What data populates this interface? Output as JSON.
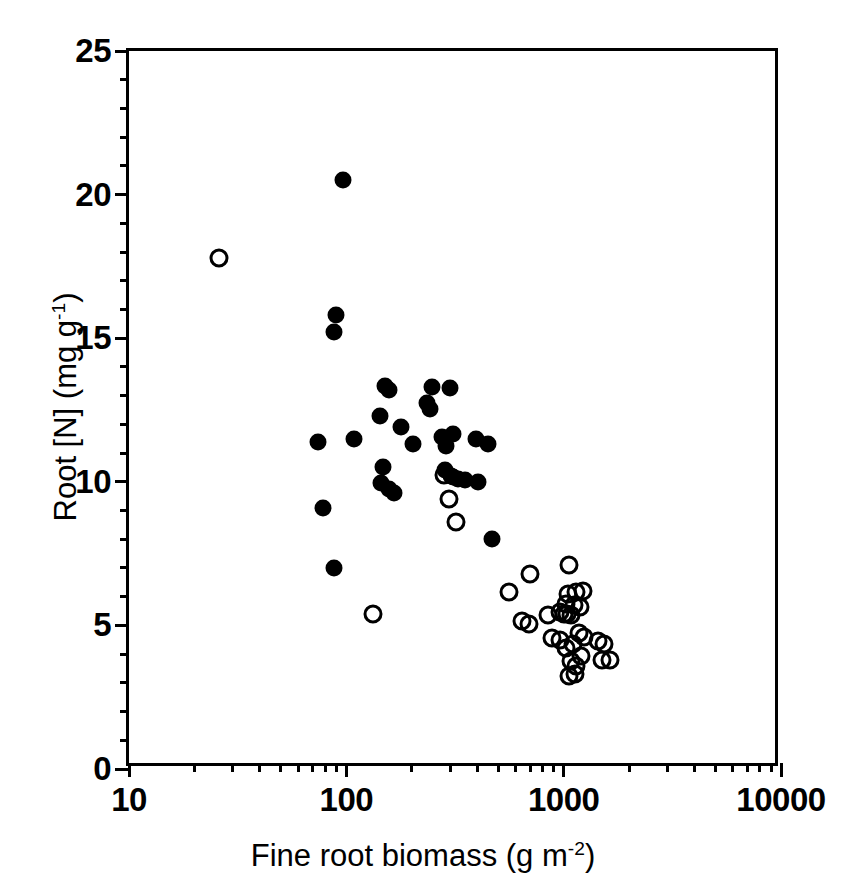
{
  "figure": {
    "background_color": "#ffffff",
    "foreground_color": "#000000"
  },
  "chart_data": {
    "type": "scatter",
    "title": "",
    "xlabel": "Fine root biomass (g m-2)",
    "xlabel_base": "Fine root biomass (g m",
    "xlabel_exp": "-2",
    "xlabel_tail": ")",
    "ylabel": "Root [N] (mg g-1)",
    "ylabel_base": "Root [N] (mg g",
    "ylabel_exp": "-1",
    "ylabel_tail": ")",
    "xscale": "log",
    "yscale": "linear",
    "xlim": [
      10,
      10000
    ],
    "ylim": [
      0,
      25
    ],
    "grid": false,
    "legend": null,
    "x_ticks_major": [
      10,
      100,
      1000,
      10000
    ],
    "x_tick_labels": [
      "10",
      "100",
      "1000",
      "10000"
    ],
    "x_ticks_minor": [
      20,
      30,
      40,
      50,
      60,
      70,
      80,
      90,
      200,
      300,
      400,
      500,
      600,
      700,
      800,
      900,
      2000,
      3000,
      4000,
      5000,
      6000,
      7000,
      8000,
      9000
    ],
    "y_ticks_major": [
      0,
      5,
      10,
      15,
      20,
      25
    ],
    "y_tick_labels": [
      "0",
      "5",
      "10",
      "15",
      "20",
      "25"
    ],
    "y_ticks_minor": [
      1,
      2,
      3,
      4,
      6,
      7,
      8,
      9,
      11,
      12,
      13,
      14,
      16,
      17,
      18,
      19,
      21,
      22,
      23,
      24
    ],
    "marker_color": "#000000",
    "series": [
      {
        "name": "filled-circles",
        "marker": "filled-circle",
        "color": "#000000",
        "points": [
          [
            97,
            20.5
          ],
          [
            90,
            15.8
          ],
          [
            88,
            15.2
          ],
          [
            74,
            11.4
          ],
          [
            151,
            13.35
          ],
          [
            157,
            13.2
          ],
          [
            247,
            13.3
          ],
          [
            300,
            13.25
          ],
          [
            143,
            12.3
          ],
          [
            236,
            12.75
          ],
          [
            242,
            12.55
          ],
          [
            108,
            11.5
          ],
          [
            178,
            11.9
          ],
          [
            202,
            11.3
          ],
          [
            277,
            11.55
          ],
          [
            308,
            11.65
          ],
          [
            395,
            11.5
          ],
          [
            286,
            11.25
          ],
          [
            450,
            11.3
          ],
          [
            78,
            9.1
          ],
          [
            148,
            10.5
          ],
          [
            145,
            9.95
          ],
          [
            157,
            9.75
          ],
          [
            166,
            9.6
          ],
          [
            284,
            10.4
          ],
          [
            303,
            10.2
          ],
          [
            311,
            10.15
          ],
          [
            327,
            10.1
          ],
          [
            352,
            10.05
          ],
          [
            404,
            10.0
          ],
          [
            88,
            7.0
          ],
          [
            470,
            8.0
          ]
        ]
      },
      {
        "name": "open-circles",
        "marker": "open-circle",
        "color": "#000000",
        "points": [
          [
            26,
            17.8
          ],
          [
            281,
            10.25
          ],
          [
            297,
            9.4
          ],
          [
            320,
            8.6
          ],
          [
            132,
            5.4
          ],
          [
            560,
            6.15
          ],
          [
            700,
            6.8
          ],
          [
            1060,
            7.1
          ],
          [
            640,
            5.15
          ],
          [
            690,
            5.05
          ],
          [
            845,
            5.35
          ],
          [
            1050,
            6.1
          ],
          [
            1140,
            6.15
          ],
          [
            1230,
            6.2
          ],
          [
            1030,
            5.75
          ],
          [
            1110,
            5.7
          ],
          [
            1190,
            5.65
          ],
          [
            960,
            5.45
          ],
          [
            1000,
            5.4
          ],
          [
            1040,
            5.4
          ],
          [
            1080,
            5.35
          ],
          [
            880,
            4.55
          ],
          [
            960,
            4.5
          ],
          [
            1020,
            4.2
          ],
          [
            1100,
            4.35
          ],
          [
            1180,
            4.75
          ],
          [
            1240,
            4.6
          ],
          [
            1080,
            3.75
          ],
          [
            1140,
            3.6
          ],
          [
            1200,
            3.95
          ],
          [
            1060,
            3.25
          ],
          [
            1130,
            3.3
          ],
          [
            1440,
            4.45
          ],
          [
            1530,
            4.35
          ],
          [
            1500,
            3.8
          ],
          [
            1640,
            3.8
          ]
        ]
      }
    ]
  }
}
